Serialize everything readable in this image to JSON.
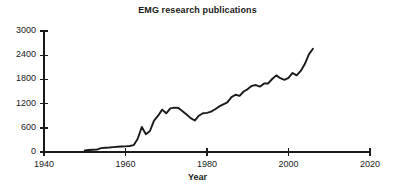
{
  "chart_data": {
    "type": "line",
    "title": "EMG research publications",
    "xlabel": "Year",
    "ylabel": "",
    "xlim": [
      1940,
      2020
    ],
    "ylim": [
      0,
      3000
    ],
    "xticks": [
      1940,
      1960,
      1980,
      2000,
      2020
    ],
    "yticks": [
      0,
      600,
      1200,
      1800,
      2400,
      3000
    ],
    "grid": false,
    "legend": false,
    "line_color": "#1a1a1a",
    "series": [
      {
        "name": "EMG research publications",
        "x": [
          1950,
          1951,
          1952,
          1953,
          1954,
          1955,
          1956,
          1957,
          1958,
          1959,
          1960,
          1961,
          1962,
          1963,
          1964,
          1965,
          1966,
          1967,
          1968,
          1969,
          1970,
          1971,
          1972,
          1973,
          1974,
          1975,
          1976,
          1977,
          1978,
          1979,
          1980,
          1981,
          1982,
          1983,
          1984,
          1985,
          1986,
          1987,
          1988,
          1989,
          1990,
          1991,
          1992,
          1993,
          1994,
          1995,
          1996,
          1997,
          1998,
          1999,
          2000,
          2001,
          2002,
          2003,
          2004,
          2005,
          2006
        ],
        "values": [
          40,
          50,
          55,
          60,
          95,
          105,
          110,
          120,
          130,
          135,
          140,
          150,
          170,
          330,
          620,
          440,
          520,
          780,
          900,
          1050,
          960,
          1080,
          1100,
          1090,
          1010,
          930,
          840,
          780,
          900,
          960,
          970,
          1000,
          1060,
          1130,
          1180,
          1230,
          1360,
          1420,
          1390,
          1500,
          1560,
          1640,
          1660,
          1620,
          1700,
          1700,
          1810,
          1900,
          1830,
          1790,
          1840,
          1960,
          1900,
          2010,
          2180,
          2420,
          2560
        ]
      }
    ],
    "ytick_labels": [
      "0",
      "600",
      "1200",
      "1800",
      "2400",
      "3000"
    ],
    "xtick_labels": [
      "1940",
      "1960",
      "1980",
      "2000",
      "2020"
    ]
  },
  "axis_geometry": {
    "x_origin_px": 44,
    "x_end_px": 370,
    "y_zero_px": 152,
    "y_top_px": 31
  }
}
